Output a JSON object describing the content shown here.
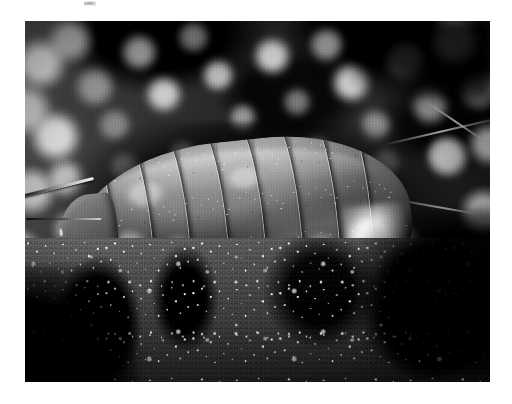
{
  "canvas": {
    "width": 512,
    "height": 404,
    "background_color": "#ffffff"
  },
  "photo": {
    "kind": "photograph",
    "subject": "woodlouse",
    "subject_common_names": "woodlouse / sowbug / pill bug",
    "scene": "macro photograph of a woodlouse crawling over granular soil and stones",
    "color_mode": "black and white",
    "orientation": "landscape",
    "frame": {
      "left": 25,
      "top": 21,
      "width": 465,
      "height": 361
    },
    "border_color": "#ffffff",
    "palette": {
      "darkest": "#0d0d0d",
      "shadow": "#242424",
      "midtone": "#5a5a5a",
      "highlight": "#e8e8e8",
      "brightest": "#fafafa"
    },
    "regions": [
      {
        "name": "background",
        "description": "out-of-focus bokeh of bright soil grains against deep black shadows",
        "focus": "blurred",
        "position": "upper half"
      },
      {
        "name": "foreground-soil",
        "description": "sharply focused granular earth and crumbled stone",
        "focus": "sharp",
        "position": "lower half"
      },
      {
        "name": "twigs",
        "description": "thin pale plant stems radiating toward the right edge",
        "focus": "partly sharp",
        "position": "right"
      }
    ],
    "subject_details": {
      "pose": "in profile, head to the left, tail to the right",
      "segment_count": 9,
      "features": [
        "overlapping armoured tergite plates",
        "pale lateral blotches along each segment",
        "glossy specular highlights on the back",
        "granular dirt speckles on the carapace",
        "thin legs touching the soil",
        "antenna extending forward from the head"
      ]
    },
    "artifacts": [
      {
        "name": "scan-speck",
        "description": "faint grey speck above the photo near the top edge",
        "x": 84,
        "y": 1
      }
    ]
  }
}
